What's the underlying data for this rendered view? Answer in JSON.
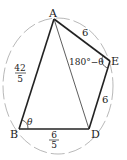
{
  "diagram": {
    "type": "cyclic-quadrilateral",
    "vertices": {
      "A": {
        "label": "A",
        "x": 54,
        "y": 19
      },
      "E": {
        "label": "E",
        "x": 110,
        "y": 61
      },
      "D": {
        "label": "D",
        "x": 89,
        "y": 129
      },
      "B": {
        "label": "B",
        "x": 19,
        "y": 129
      }
    },
    "sides": {
      "AB": {
        "num": "42",
        "den": "5"
      },
      "AE": {
        "value": "6"
      },
      "ED": {
        "value": "6"
      },
      "BD": {
        "num": "6",
        "den": "5"
      }
    },
    "angles": {
      "B": "θ",
      "E": "180°−θ"
    },
    "diagonal": "AD",
    "colors": {
      "edge": "#222222",
      "circle": "#999999"
    }
  }
}
